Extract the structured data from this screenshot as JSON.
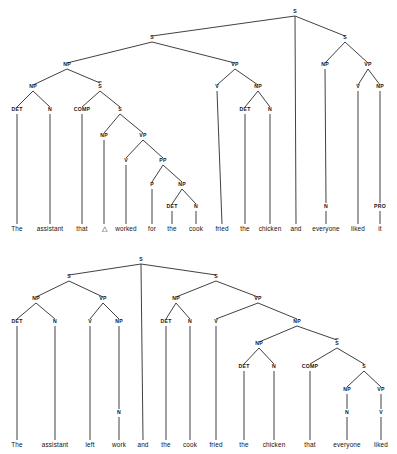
{
  "figure": {
    "line_color": "#2b2b2b",
    "text_color": "#151515",
    "background": "#ffffff"
  },
  "trees": [
    {
      "id": "tree-top",
      "name": "coordinated-sentence-with-relative-clause",
      "sentence": "The assistant that △ worked for the cook fried the chicken and everyone liked it",
      "words": [
        {
          "text": "The",
          "x": 17,
          "y": 231
        },
        {
          "text": "assistant",
          "x": 50,
          "y": 231
        },
        {
          "text": "that",
          "x": 82,
          "y": 231
        },
        {
          "text": "△",
          "x": 104,
          "y": 231
        },
        {
          "text": "worked",
          "x": 126,
          "y": 231
        },
        {
          "text": "for",
          "x": 152,
          "y": 231
        },
        {
          "text": "the",
          "x": 172,
          "y": 231
        },
        {
          "text": "cook",
          "x": 196,
          "y": 231
        },
        {
          "text": "fried",
          "x": 222,
          "y": 231
        },
        {
          "text": "the",
          "x": 245,
          "y": 231
        },
        {
          "text": "chicken",
          "x": 270,
          "y": 231
        },
        {
          "text": "and",
          "x": 296,
          "y": 231
        },
        {
          "text": "everyone",
          "x": 326,
          "y": 231
        },
        {
          "text": "liked",
          "x": 358,
          "y": 231
        },
        {
          "text": "it",
          "x": 380,
          "y": 231
        }
      ],
      "nodes": [
        {
          "label": "S",
          "x": 295,
          "y": 13,
          "bar": false
        },
        {
          "label": "S",
          "x": 152,
          "y": 39,
          "bar": false
        },
        {
          "label": "S",
          "x": 345,
          "y": 39,
          "bar": false
        },
        {
          "label": "NP",
          "x": 67,
          "y": 66,
          "bar": false
        },
        {
          "label": "VP",
          "x": 235,
          "y": 66,
          "bar": false
        },
        {
          "label": "NP",
          "x": 325,
          "y": 66,
          "bar": false
        },
        {
          "label": "VP",
          "x": 368,
          "y": 66,
          "bar": false
        },
        {
          "label": "NP",
          "x": 33,
          "y": 88,
          "bar": false
        },
        {
          "label": "S",
          "x": 100,
          "y": 88,
          "bar": true
        },
        {
          "label": "V",
          "x": 217,
          "y": 88,
          "bar": false
        },
        {
          "label": "NP",
          "x": 258,
          "y": 88,
          "bar": false
        },
        {
          "label": "V",
          "x": 358,
          "y": 88,
          "bar": false
        },
        {
          "label": "NP",
          "x": 380,
          "y": 88,
          "bar": false
        },
        {
          "label": "DET",
          "x": 17,
          "y": 111,
          "bar": false
        },
        {
          "label": "N",
          "x": 50,
          "y": 111,
          "bar": false
        },
        {
          "label": "COMP",
          "x": 82,
          "y": 111,
          "bar": false
        },
        {
          "label": "S",
          "x": 120,
          "y": 111,
          "bar": false
        },
        {
          "label": "DET",
          "x": 245,
          "y": 111,
          "bar": false
        },
        {
          "label": "N",
          "x": 270,
          "y": 111,
          "bar": false
        },
        {
          "label": "NP",
          "x": 104,
          "y": 137,
          "bar": false
        },
        {
          "label": "VP",
          "x": 143,
          "y": 137,
          "bar": false
        },
        {
          "label": "V",
          "x": 126,
          "y": 162,
          "bar": false
        },
        {
          "label": "PP",
          "x": 163,
          "y": 162,
          "bar": false
        },
        {
          "label": "P",
          "x": 152,
          "y": 186,
          "bar": false
        },
        {
          "label": "NP",
          "x": 182,
          "y": 186,
          "bar": false
        },
        {
          "label": "DET",
          "x": 172,
          "y": 208,
          "bar": false
        },
        {
          "label": "N",
          "x": 196,
          "y": 208,
          "bar": false
        },
        {
          "label": "N",
          "x": 326,
          "y": 208,
          "bar": false
        },
        {
          "label": "PRO",
          "x": 380,
          "y": 208,
          "bar": false
        }
      ],
      "edges": [
        {
          "x1": 295,
          "y1": 16,
          "x2": 152,
          "y2": 36
        },
        {
          "x1": 295,
          "y1": 16,
          "x2": 296,
          "y2": 224
        },
        {
          "x1": 295,
          "y1": 16,
          "x2": 345,
          "y2": 36
        },
        {
          "x1": 152,
          "y1": 42,
          "x2": 67,
          "y2": 63
        },
        {
          "x1": 152,
          "y1": 42,
          "x2": 235,
          "y2": 63
        },
        {
          "x1": 345,
          "y1": 42,
          "x2": 325,
          "y2": 63
        },
        {
          "x1": 345,
          "y1": 42,
          "x2": 368,
          "y2": 63
        },
        {
          "x1": 67,
          "y1": 69,
          "x2": 33,
          "y2": 85
        },
        {
          "x1": 67,
          "y1": 69,
          "x2": 100,
          "y2": 83
        },
        {
          "x1": 235,
          "y1": 69,
          "x2": 217,
          "y2": 85
        },
        {
          "x1": 235,
          "y1": 69,
          "x2": 258,
          "y2": 85
        },
        {
          "x1": 325,
          "y1": 69,
          "x2": 326,
          "y2": 203
        },
        {
          "x1": 368,
          "y1": 69,
          "x2": 358,
          "y2": 85
        },
        {
          "x1": 368,
          "y1": 69,
          "x2": 380,
          "y2": 85
        },
        {
          "x1": 33,
          "y1": 91,
          "x2": 17,
          "y2": 107
        },
        {
          "x1": 33,
          "y1": 91,
          "x2": 50,
          "y2": 107
        },
        {
          "x1": 100,
          "y1": 91,
          "x2": 82,
          "y2": 107
        },
        {
          "x1": 100,
          "y1": 91,
          "x2": 120,
          "y2": 107
        },
        {
          "x1": 217,
          "y1": 91,
          "x2": 222,
          "y2": 224
        },
        {
          "x1": 258,
          "y1": 91,
          "x2": 245,
          "y2": 107
        },
        {
          "x1": 258,
          "y1": 91,
          "x2": 270,
          "y2": 107
        },
        {
          "x1": 358,
          "y1": 91,
          "x2": 358,
          "y2": 224
        },
        {
          "x1": 380,
          "y1": 91,
          "x2": 380,
          "y2": 203
        },
        {
          "x1": 17,
          "y1": 114,
          "x2": 17,
          "y2": 224
        },
        {
          "x1": 50,
          "y1": 114,
          "x2": 50,
          "y2": 224
        },
        {
          "x1": 82,
          "y1": 114,
          "x2": 82,
          "y2": 224
        },
        {
          "x1": 120,
          "y1": 114,
          "x2": 104,
          "y2": 133
        },
        {
          "x1": 120,
          "y1": 114,
          "x2": 143,
          "y2": 133
        },
        {
          "x1": 245,
          "y1": 114,
          "x2": 245,
          "y2": 224
        },
        {
          "x1": 270,
          "y1": 114,
          "x2": 270,
          "y2": 224
        },
        {
          "x1": 104,
          "y1": 140,
          "x2": 104,
          "y2": 224
        },
        {
          "x1": 143,
          "y1": 140,
          "x2": 126,
          "y2": 158
        },
        {
          "x1": 143,
          "y1": 140,
          "x2": 163,
          "y2": 158
        },
        {
          "x1": 126,
          "y1": 165,
          "x2": 126,
          "y2": 224
        },
        {
          "x1": 163,
          "y1": 165,
          "x2": 152,
          "y2": 182
        },
        {
          "x1": 163,
          "y1": 165,
          "x2": 182,
          "y2": 182
        },
        {
          "x1": 152,
          "y1": 189,
          "x2": 152,
          "y2": 224
        },
        {
          "x1": 182,
          "y1": 189,
          "x2": 172,
          "y2": 204
        },
        {
          "x1": 182,
          "y1": 189,
          "x2": 196,
          "y2": 204
        },
        {
          "x1": 172,
          "y1": 211,
          "x2": 172,
          "y2": 224
        },
        {
          "x1": 196,
          "y1": 211,
          "x2": 196,
          "y2": 224
        },
        {
          "x1": 326,
          "y1": 211,
          "x2": 326,
          "y2": 224
        },
        {
          "x1": 380,
          "y1": 211,
          "x2": 380,
          "y2": 224
        }
      ]
    },
    {
      "id": "tree-bottom",
      "name": "coordinated-sentence-with-object-relative-clause",
      "sentence": "The assistant left work and the cook fried the chicken that everyone liked",
      "words": [
        {
          "text": "The",
          "x": 17,
          "y": 193
        },
        {
          "text": "assistant",
          "x": 55,
          "y": 193
        },
        {
          "text": "left",
          "x": 90,
          "y": 193
        },
        {
          "text": "work",
          "x": 119,
          "y": 193
        },
        {
          "text": "and",
          "x": 143,
          "y": 193
        },
        {
          "text": "the",
          "x": 166,
          "y": 193
        },
        {
          "text": "cook",
          "x": 190,
          "y": 193
        },
        {
          "text": "fried",
          "x": 216,
          "y": 193
        },
        {
          "text": "the",
          "x": 244,
          "y": 193
        },
        {
          "text": "chicken",
          "x": 274,
          "y": 193
        },
        {
          "text": "that",
          "x": 310,
          "y": 193
        },
        {
          "text": "everyone",
          "x": 347,
          "y": 193
        },
        {
          "text": "liked",
          "x": 381,
          "y": 193
        }
      ],
      "nodes": [
        {
          "label": "S",
          "x": 141,
          "y": 7,
          "bar": false
        },
        {
          "label": "S",
          "x": 69,
          "y": 24,
          "bar": false
        },
        {
          "label": "S",
          "x": 216,
          "y": 24,
          "bar": false
        },
        {
          "label": "NP",
          "x": 36,
          "y": 46,
          "bar": false
        },
        {
          "label": "VP",
          "x": 103,
          "y": 46,
          "bar": false
        },
        {
          "label": "NP",
          "x": 176,
          "y": 46,
          "bar": false
        },
        {
          "label": "VP",
          "x": 258,
          "y": 46,
          "bar": false
        },
        {
          "label": "DET",
          "x": 17,
          "y": 69,
          "bar": false
        },
        {
          "label": "N",
          "x": 55,
          "y": 69,
          "bar": false
        },
        {
          "label": "V",
          "x": 90,
          "y": 69,
          "bar": false
        },
        {
          "label": "NP",
          "x": 119,
          "y": 69,
          "bar": false
        },
        {
          "label": "DET",
          "x": 166,
          "y": 69,
          "bar": false
        },
        {
          "label": "N",
          "x": 190,
          "y": 69,
          "bar": false
        },
        {
          "label": "V",
          "x": 216,
          "y": 69,
          "bar": false
        },
        {
          "label": "NP",
          "x": 297,
          "y": 69,
          "bar": false
        },
        {
          "label": "NP",
          "x": 259,
          "y": 91,
          "bar": false
        },
        {
          "label": "S",
          "x": 337,
          "y": 91,
          "bar": true
        },
        {
          "label": "DET",
          "x": 244,
          "y": 114,
          "bar": false
        },
        {
          "label": "N",
          "x": 274,
          "y": 114,
          "bar": false
        },
        {
          "label": "COMP",
          "x": 310,
          "y": 114,
          "bar": false
        },
        {
          "label": "S",
          "x": 364,
          "y": 114,
          "bar": false
        },
        {
          "label": "NP",
          "x": 347,
          "y": 137,
          "bar": false
        },
        {
          "label": "VP",
          "x": 381,
          "y": 137,
          "bar": false
        },
        {
          "label": "N",
          "x": 119,
          "y": 160,
          "bar": false
        },
        {
          "label": "N",
          "x": 347,
          "y": 160,
          "bar": false
        },
        {
          "label": "V",
          "x": 381,
          "y": 160,
          "bar": false
        }
      ],
      "edges": [
        {
          "x1": 141,
          "y1": 10,
          "x2": 69,
          "y2": 21
        },
        {
          "x1": 141,
          "y1": 10,
          "x2": 143,
          "y2": 186
        },
        {
          "x1": 141,
          "y1": 10,
          "x2": 216,
          "y2": 21
        },
        {
          "x1": 69,
          "y1": 27,
          "x2": 36,
          "y2": 43
        },
        {
          "x1": 69,
          "y1": 27,
          "x2": 103,
          "y2": 43
        },
        {
          "x1": 216,
          "y1": 27,
          "x2": 176,
          "y2": 43
        },
        {
          "x1": 216,
          "y1": 27,
          "x2": 258,
          "y2": 43
        },
        {
          "x1": 36,
          "y1": 49,
          "x2": 17,
          "y2": 65
        },
        {
          "x1": 36,
          "y1": 49,
          "x2": 55,
          "y2": 65
        },
        {
          "x1": 103,
          "y1": 49,
          "x2": 90,
          "y2": 65
        },
        {
          "x1": 103,
          "y1": 49,
          "x2": 119,
          "y2": 65
        },
        {
          "x1": 176,
          "y1": 49,
          "x2": 166,
          "y2": 65
        },
        {
          "x1": 176,
          "y1": 49,
          "x2": 190,
          "y2": 65
        },
        {
          "x1": 258,
          "y1": 49,
          "x2": 216,
          "y2": 65
        },
        {
          "x1": 258,
          "y1": 49,
          "x2": 297,
          "y2": 65
        },
        {
          "x1": 17,
          "y1": 72,
          "x2": 17,
          "y2": 186
        },
        {
          "x1": 55,
          "y1": 72,
          "x2": 55,
          "y2": 186
        },
        {
          "x1": 90,
          "y1": 72,
          "x2": 90,
          "y2": 186
        },
        {
          "x1": 119,
          "y1": 72,
          "x2": 119,
          "y2": 155
        },
        {
          "x1": 166,
          "y1": 72,
          "x2": 166,
          "y2": 186
        },
        {
          "x1": 190,
          "y1": 72,
          "x2": 190,
          "y2": 186
        },
        {
          "x1": 216,
          "y1": 72,
          "x2": 216,
          "y2": 186
        },
        {
          "x1": 297,
          "y1": 72,
          "x2": 259,
          "y2": 88
        },
        {
          "x1": 297,
          "y1": 72,
          "x2": 337,
          "y2": 86
        },
        {
          "x1": 259,
          "y1": 94,
          "x2": 244,
          "y2": 110
        },
        {
          "x1": 259,
          "y1": 94,
          "x2": 274,
          "y2": 110
        },
        {
          "x1": 337,
          "y1": 94,
          "x2": 310,
          "y2": 110
        },
        {
          "x1": 337,
          "y1": 94,
          "x2": 364,
          "y2": 110
        },
        {
          "x1": 244,
          "y1": 117,
          "x2": 244,
          "y2": 186
        },
        {
          "x1": 274,
          "y1": 117,
          "x2": 274,
          "y2": 186
        },
        {
          "x1": 310,
          "y1": 117,
          "x2": 310,
          "y2": 186
        },
        {
          "x1": 364,
          "y1": 117,
          "x2": 347,
          "y2": 133
        },
        {
          "x1": 364,
          "y1": 117,
          "x2": 381,
          "y2": 133
        },
        {
          "x1": 347,
          "y1": 140,
          "x2": 347,
          "y2": 155
        },
        {
          "x1": 381,
          "y1": 140,
          "x2": 381,
          "y2": 155
        },
        {
          "x1": 119,
          "y1": 163,
          "x2": 119,
          "y2": 186
        },
        {
          "x1": 347,
          "y1": 163,
          "x2": 347,
          "y2": 186
        },
        {
          "x1": 381,
          "y1": 163,
          "x2": 381,
          "y2": 186
        }
      ]
    }
  ]
}
